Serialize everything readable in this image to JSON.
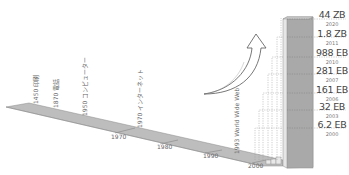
{
  "diagram": {
    "type": "data-growth-timeline",
    "timeline": {
      "axis_ticks": [
        {
          "label": "1970",
          "x": 111,
          "y": 135
        },
        {
          "label": "1980",
          "x": 157,
          "y": 145
        },
        {
          "label": "1990",
          "x": 203,
          "y": 153
        },
        {
          "label": "2000",
          "x": 248,
          "y": 163
        }
      ],
      "events": [
        {
          "label": "1450 印刷",
          "x": 39,
          "y": 104
        },
        {
          "label": "1870 電話",
          "x": 59,
          "y": 108
        },
        {
          "label": "1950 コンピューター",
          "x": 88,
          "y": 116
        },
        {
          "label": "1970 インターネット",
          "x": 143,
          "y": 128
        },
        {
          "label": "1993 World Wide Web",
          "x": 240,
          "y": 154
        }
      ]
    },
    "data_volumes": [
      {
        "value": "44 ZB",
        "year": "2020"
      },
      {
        "value": "1.8 ZB",
        "year": "2011"
      },
      {
        "value": "988 EB",
        "year": "2010"
      },
      {
        "value": "281 EB",
        "year": "2007"
      },
      {
        "value": "161 EB",
        "year": "2006"
      },
      {
        "value": "32 EB",
        "year": "2003"
      },
      {
        "value": "6.2 EB",
        "year": "2000"
      }
    ],
    "colors": {
      "bar_face": "#a8a8a8",
      "bar_side": "#e4e4e4",
      "timeline_fill": "#b9b9b9",
      "dash": "#9a9a9a",
      "text": "#444444"
    }
  }
}
